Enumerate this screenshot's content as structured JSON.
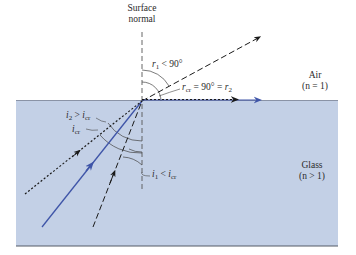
{
  "diagram": {
    "media": {
      "upper": {
        "name": "Air",
        "index_label": "(n = 1)",
        "color": "#ffffff"
      },
      "lower": {
        "name": "Glass",
        "index_label": "(n > 1)",
        "color": "#c3d0e6"
      }
    },
    "normal_label": {
      "line1": "Surface",
      "line2": "normal"
    },
    "labels": {
      "r1": "r₁ < 90°",
      "rcr": "r_cr = 90° = r₂",
      "i2": "i₂ > i_cr",
      "icr": "i_cr",
      "i1": "i₁ < i_cr"
    },
    "rays": [
      {
        "id": "ray-1",
        "style": "dashed",
        "color": "#1a1a1a",
        "incident_angle": "i1 < icr",
        "refracted": "r1 < 90°"
      },
      {
        "id": "ray-critical",
        "style": "solid",
        "color": "#3f55a8",
        "incident_angle": "icr",
        "refracted": "rcr = 90° (along surface)"
      },
      {
        "id": "ray-2",
        "style": "dotted",
        "color": "#1a1a1a",
        "incident_angle": "i2 > icr",
        "refracted": "r2 = 90° (along surface)"
      }
    ],
    "colors": {
      "glass_fill": "#c3d0e6",
      "glass_border": "#555a66",
      "critical_ray": "#3f55a8",
      "ink": "#1a1a1a"
    }
  }
}
